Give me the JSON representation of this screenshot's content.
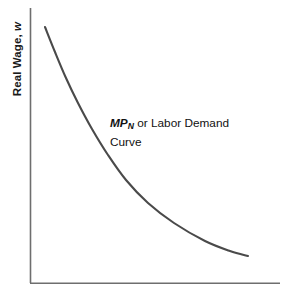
{
  "figure": {
    "title": "",
    "background_color": "#ffffff",
    "width": 286,
    "height": 295
  },
  "axes": {
    "y_axis": {
      "label_prefix": "Real Wage, ",
      "label_variable": "w",
      "color": "#6e6e6e",
      "x_position": 30,
      "y_top": 8,
      "y_bottom": 283
    },
    "x_axis": {
      "label": "",
      "color": "#6e6e6e",
      "y_position": 283,
      "x_left": 30,
      "x_right": 280
    }
  },
  "annotations": {
    "curve_label": {
      "symbol": "MP",
      "subscript": "N",
      "line1_rest": " or Labor Demand",
      "line2": "Curve",
      "color": "#111111"
    }
  },
  "chart_data": {
    "type": "line",
    "title": "",
    "xlabel": "",
    "ylabel": "Real Wage, w",
    "grid": false,
    "legend": null,
    "series": [
      {
        "name": "MP_N or Labor Demand Curve",
        "color": "#4a4a4a",
        "line_width": 2.1,
        "shape": "convex-decreasing",
        "points": [
          [
            45,
            27
          ],
          [
            55,
            52
          ],
          [
            66,
            78
          ],
          [
            78,
            103
          ],
          [
            92,
            129
          ],
          [
            108,
            155
          ],
          [
            126,
            180
          ],
          [
            148,
            203
          ],
          [
            174,
            223
          ],
          [
            205,
            241
          ],
          [
            230,
            251
          ],
          [
            248,
            256
          ]
        ]
      }
    ],
    "xlim": [
      30,
      280
    ],
    "ylim": [
      283,
      8
    ]
  }
}
